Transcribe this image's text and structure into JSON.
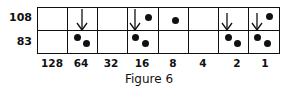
{
  "figure": {
    "caption": "Figure 6",
    "row_labels": [
      "108",
      "83"
    ],
    "column_labels": [
      "128",
      "64",
      "32",
      "16",
      "8",
      "4",
      "2",
      "1"
    ],
    "cells": {
      "top": [
        {
          "arrow": false,
          "dots": 0
        },
        {
          "arrow": true,
          "dots": 0
        },
        {
          "arrow": false,
          "dots": 0
        },
        {
          "arrow": true,
          "dots": 1
        },
        {
          "arrow": false,
          "dots": 1
        },
        {
          "arrow": false,
          "dots": 0
        },
        {
          "arrow": true,
          "dots": 0
        },
        {
          "arrow": true,
          "dots": 1
        }
      ],
      "bottom": [
        {
          "dots": 0
        },
        {
          "dots": 2
        },
        {
          "dots": 0
        },
        {
          "dots": 2
        },
        {
          "dots": 0
        },
        {
          "dots": 0
        },
        {
          "dots": 2
        },
        {
          "dots": 2
        }
      ]
    },
    "colors": {
      "ink": "#111111",
      "background": "#ffffff"
    }
  }
}
